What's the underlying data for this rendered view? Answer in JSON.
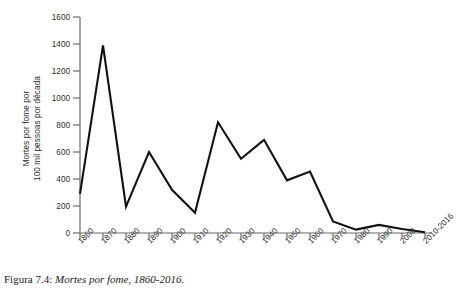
{
  "figure": {
    "caption_label": "Figura 7.4:",
    "caption_text": "Mortes por fome, 1860-2016.",
    "line_color": "#111111",
    "axis_color": "#6b6b6b",
    "background_color": "#ffffff"
  },
  "axes": {
    "y_title_line1": "Mortes por fome por",
    "y_title_line2": "100 mil pessoas por década",
    "y_ticks": [
      "0",
      "200",
      "400",
      "600",
      "800",
      "1000",
      "1200",
      "1400",
      "1600"
    ],
    "x_ticks": [
      "1860",
      "1870",
      "1880",
      "1890",
      "1900",
      "1910",
      "1920",
      "1930",
      "1940",
      "1950",
      "1960",
      "1970",
      "1980",
      "1990",
      "2000",
      "2010-2016"
    ]
  },
  "chart_data": {
    "type": "line",
    "title": "Mortes por fome, 1860-2016",
    "xlabel": "",
    "ylabel": "Mortes por fome por 100 mil pessoas por década",
    "categories": [
      "1860",
      "1870",
      "1880",
      "1890",
      "1900",
      "1910",
      "1920",
      "1930",
      "1940",
      "1950",
      "1960",
      "1970",
      "1980",
      "1990",
      "2000",
      "2010-2016"
    ],
    "values": [
      290,
      1390,
      195,
      600,
      320,
      150,
      820,
      550,
      690,
      390,
      455,
      85,
      25,
      60,
      30,
      5
    ],
    "ylim": [
      0,
      1600
    ],
    "ytick_step": 200,
    "grid": false,
    "legend": false
  }
}
